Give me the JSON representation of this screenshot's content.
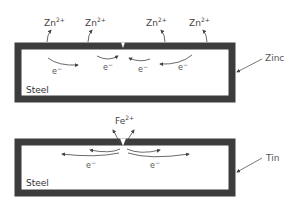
{
  "top_panel": {
    "coating_label": "Zinc",
    "base_label": "Steel",
    "ion_label": "Zn",
    "ion_charge": "2+",
    "electron_label": "e",
    "electron_charge": "−"
  },
  "bottom_panel": {
    "coating_label": "Tin",
    "base_label": "Steel",
    "ion_label": "Fe",
    "ion_charge": "2+",
    "electron_label": "e",
    "electron_charge": "−"
  },
  "colors": {
    "coating": "#3c3c3c",
    "arrow": "#444444",
    "background": "#ffffff"
  }
}
